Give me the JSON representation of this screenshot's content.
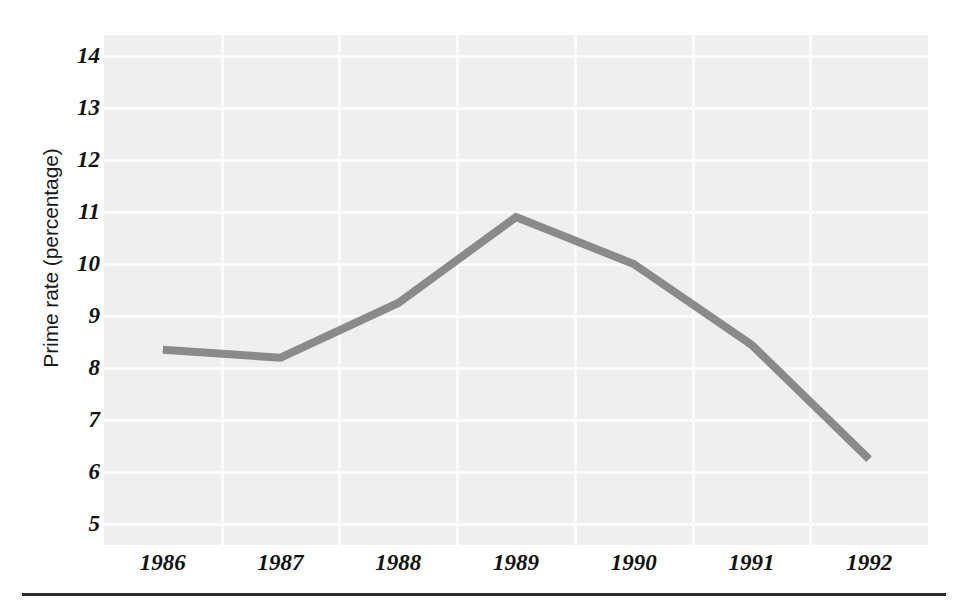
{
  "chart_data": {
    "type": "line",
    "title": "",
    "xlabel": "",
    "ylabel": "Prime rate (percentage)",
    "categories": [
      "1986",
      "1987",
      "1988",
      "1989",
      "1990",
      "1991",
      "1992"
    ],
    "x": [
      1986,
      1987,
      1988,
      1989,
      1990,
      1991,
      1992
    ],
    "values": [
      8.35,
      8.2,
      9.25,
      10.9,
      10.0,
      8.45,
      6.25
    ],
    "series": [
      {
        "name": "Prime rate",
        "values": [
          8.35,
          8.2,
          9.25,
          10.9,
          10.0,
          8.45,
          6.25
        ],
        "color": "#8a8a8a"
      }
    ],
    "ylim": [
      4.6,
      14.4
    ],
    "yticks": [
      14,
      13,
      12,
      11,
      10,
      9,
      8,
      7,
      6,
      5
    ],
    "ytick_labels": [
      "14",
      "13",
      "12",
      "11",
      "10",
      "9",
      "8",
      "7",
      "6",
      "5"
    ],
    "xtick_labels": [
      "1986",
      "1987",
      "1988",
      "1989",
      "1990",
      "1991",
      "1992"
    ],
    "grid": true,
    "grid_color": "#fbfbfb",
    "legend": false,
    "legend_position": "none",
    "plot_background": "#efefef",
    "line_color": "#8a8a8a",
    "line_width": 8
  },
  "figure": {
    "background": "#ffffff",
    "rule_color": "#2b2b2b"
  }
}
